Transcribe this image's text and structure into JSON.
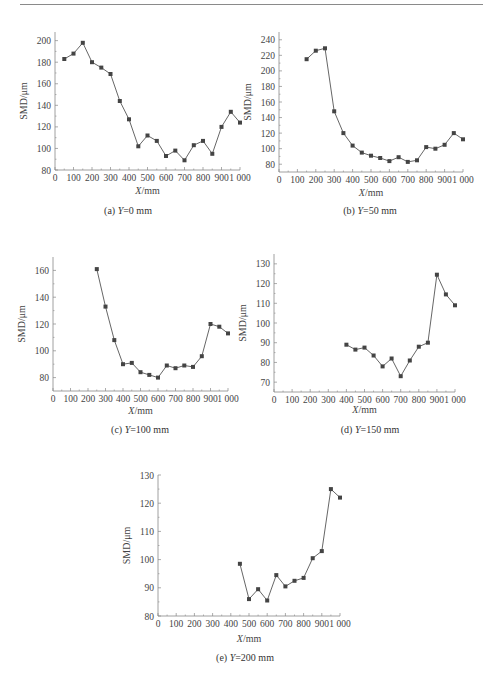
{
  "chart_data": [
    {
      "type": "line",
      "caption": "(a) Y=0 mm",
      "caption_prefix": "(a) ",
      "caption_var": "Y",
      "caption_suffix": "=0 mm",
      "xlabel": "X/mm",
      "ylabel": "SMD/μm",
      "xlim": [
        0,
        1000
      ],
      "ylim": [
        80,
        208
      ],
      "xticks": [
        0,
        100,
        200,
        300,
        400,
        500,
        600,
        700,
        800,
        900,
        1000
      ],
      "xtick_labels": [
        "0",
        "100",
        "200",
        "300",
        "400",
        "500",
        "600",
        "700",
        "800",
        "900",
        "1 000"
      ],
      "yticks": [
        80,
        100,
        120,
        140,
        160,
        180,
        200
      ],
      "x": [
        50,
        100,
        150,
        200,
        250,
        300,
        350,
        400,
        450,
        500,
        550,
        600,
        650,
        700,
        750,
        800,
        850,
        900,
        950,
        1000
      ],
      "y": [
        183,
        188,
        198,
        180,
        175,
        169,
        144,
        127,
        102,
        112,
        107,
        93,
        98,
        89,
        103,
        107,
        95,
        120,
        134,
        124
      ]
    },
    {
      "type": "line",
      "caption": "(b) Y=50 mm",
      "caption_prefix": "(b) ",
      "caption_var": "Y",
      "caption_suffix": "=50 mm",
      "xlabel": "X/mm",
      "ylabel": "SMD/μm",
      "xlim": [
        0,
        1000
      ],
      "ylim": [
        70,
        250
      ],
      "xticks": [
        0,
        100,
        200,
        300,
        400,
        500,
        600,
        700,
        800,
        900,
        1000
      ],
      "xtick_labels": [
        "0",
        "100",
        "200",
        "300",
        "400",
        "500",
        "600",
        "700",
        "800",
        "900",
        "1 000"
      ],
      "yticks": [
        80,
        100,
        120,
        140,
        160,
        180,
        200,
        220,
        240
      ],
      "x": [
        150,
        200,
        250,
        300,
        350,
        400,
        450,
        500,
        550,
        600,
        650,
        700,
        750,
        800,
        850,
        900,
        950,
        1000
      ],
      "y": [
        215,
        226,
        229,
        148,
        120,
        104,
        95,
        91,
        88,
        84,
        89,
        83,
        85,
        102,
        100,
        105,
        120,
        112
      ]
    },
    {
      "type": "line",
      "caption": "(c) Y=100 mm",
      "caption_prefix": "(c) ",
      "caption_var": "Y",
      "caption_suffix": "=100 mm",
      "xlabel": "X/mm",
      "ylabel": "SMD/μm",
      "xlim": [
        0,
        1000
      ],
      "ylim": [
        70,
        170
      ],
      "xticks": [
        0,
        100,
        200,
        300,
        400,
        500,
        600,
        700,
        800,
        900,
        1000
      ],
      "xtick_labels": [
        "0",
        "100",
        "200",
        "300",
        "400",
        "500",
        "600",
        "700",
        "800",
        "900",
        "1 000"
      ],
      "yticks": [
        80,
        100,
        120,
        140,
        160
      ],
      "x": [
        250,
        300,
        350,
        400,
        450,
        500,
        550,
        600,
        650,
        700,
        750,
        800,
        850,
        900,
        950,
        1000
      ],
      "y": [
        161,
        133,
        108,
        90,
        91,
        84,
        82,
        80,
        89,
        87,
        89,
        88,
        96,
        120,
        118,
        113
      ]
    },
    {
      "type": "line",
      "caption": "(d) Y=150 mm",
      "caption_prefix": "(d) ",
      "caption_var": "Y",
      "caption_suffix": "=150 mm",
      "xlabel": "X/mm",
      "ylabel": "SMD/μm",
      "xlim": [
        0,
        1000
      ],
      "ylim": [
        65,
        135
      ],
      "xticks": [
        0,
        100,
        200,
        300,
        400,
        500,
        600,
        700,
        800,
        900,
        1000
      ],
      "xtick_labels": [
        "0",
        "100",
        "200",
        "300",
        "400",
        "500",
        "600",
        "700",
        "800",
        "900",
        "1 000"
      ],
      "yticks": [
        70,
        80,
        90,
        100,
        110,
        120,
        130
      ],
      "x": [
        400,
        450,
        500,
        550,
        600,
        650,
        700,
        750,
        800,
        850,
        900,
        950,
        1000
      ],
      "y": [
        89,
        86.5,
        87.5,
        83.5,
        78,
        82,
        73,
        81,
        88,
        90,
        124.5,
        114.5,
        109
      ]
    },
    {
      "type": "line",
      "caption": "(e) Y=200 mm",
      "caption_prefix": "(e) ",
      "caption_var": "Y",
      "caption_suffix": "=200 mm",
      "xlabel": "X/mm",
      "ylabel": "SMD/μm",
      "xlim": [
        0,
        1000
      ],
      "ylim": [
        80,
        130
      ],
      "xticks": [
        0,
        100,
        200,
        300,
        400,
        500,
        600,
        700,
        800,
        900,
        1000
      ],
      "xtick_labels": [
        "0",
        "100",
        "200",
        "300",
        "400",
        "500",
        "600",
        "700",
        "800",
        "900",
        "1 000"
      ],
      "yticks": [
        80,
        90,
        100,
        110,
        120,
        130
      ],
      "x": [
        450,
        500,
        550,
        600,
        650,
        700,
        750,
        800,
        850,
        900,
        950,
        1000
      ],
      "y": [
        98.5,
        86,
        89.5,
        85.5,
        94.5,
        90.5,
        92.5,
        93.5,
        100.5,
        103,
        125,
        122
      ]
    }
  ],
  "colors": {
    "line": "#555555",
    "marker": "#444444",
    "axis": "#888888"
  }
}
